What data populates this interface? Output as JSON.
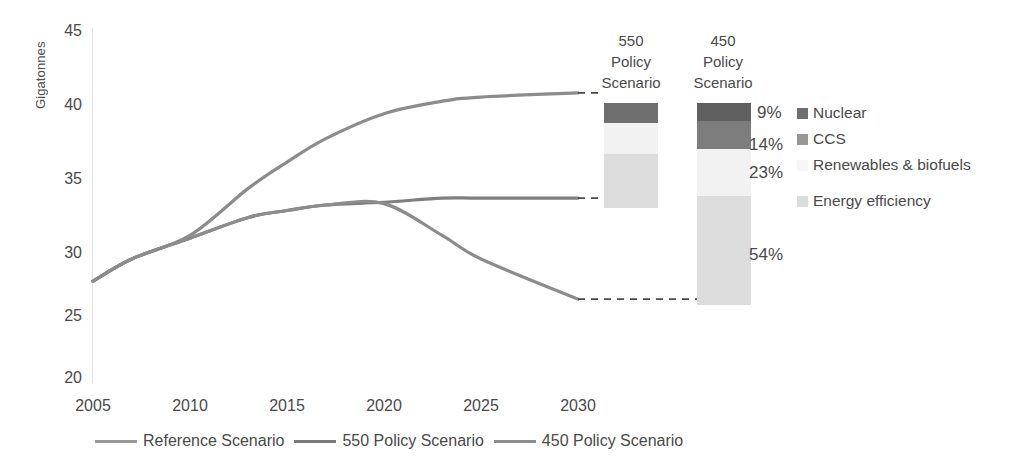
{
  "chart_data": {
    "type": "line",
    "title": "",
    "xlabel": "",
    "ylabel": "Gigatonnes",
    "xlim": [
      2005,
      2030
    ],
    "ylim": [
      20,
      45
    ],
    "grid": false,
    "legend_position": "bottom",
    "x": [
      2005,
      2010,
      2015,
      2020,
      2025,
      2030
    ],
    "yticks": [
      "45",
      "40",
      "35",
      "30",
      "25",
      "20"
    ],
    "xticks": [
      "2005",
      "2010",
      "2015",
      "2020",
      "2025",
      "2030"
    ],
    "series": [
      {
        "name": "Reference Scenario",
        "color": "#8c8c8c",
        "x": [
          2005,
          2007,
          2010,
          2013,
          2015,
          2017,
          2020,
          2023,
          2025,
          2030
        ],
        "values": [
          27.0,
          28.6,
          30.3,
          33.7,
          35.6,
          37.3,
          39.1,
          40.0,
          40.3,
          40.6
        ],
        "end_value": 40.6
      },
      {
        "name": "550 Policy Scenario",
        "color": "#7f7f7f",
        "x": [
          2005,
          2007,
          2010,
          2013,
          2015,
          2017,
          2020,
          2023,
          2025,
          2030
        ],
        "values": [
          27.0,
          28.6,
          30.1,
          31.6,
          32.1,
          32.5,
          32.7,
          33.0,
          33.0,
          33.0
        ],
        "end_value": 33.0
      },
      {
        "name": "450 Policy Scenario",
        "color": "#8c8c8c",
        "x": [
          2005,
          2007,
          2010,
          2013,
          2015,
          2017,
          2020,
          2023,
          2025,
          2030
        ],
        "values": [
          27.0,
          28.6,
          30.1,
          31.6,
          32.1,
          32.5,
          32.6,
          30.3,
          28.6,
          25.7
        ],
        "end_value": 25.7
      }
    ],
    "annotations": [
      {
        "text": "dashed connector from Reference Scenario 2030 endpoint to top of 550 Policy Scenario abatement bar",
        "value": 40.6
      },
      {
        "text": "dashed connector from 550 Policy Scenario 2030 endpoint to bottom of 550 bar / top of 450 bar region",
        "value": 33.0
      },
      {
        "text": "dashed connector from 450 Policy Scenario 2030 endpoint to bottom of 450 Policy Scenario abatement bar",
        "value": 25.7
      }
    ]
  },
  "bars": {
    "b550": {
      "header": "550\nPolicy\nScenario",
      "header_lines": [
        "550",
        "Policy",
        "Scenario"
      ],
      "top_value": 40.6,
      "bottom_value": 33.0,
      "segments": [
        {
          "name": "Nuclear",
          "share": 0.19,
          "color": "#6f6f6f"
        },
        {
          "name": "CCS",
          "share": 0.0,
          "color": "#969696"
        },
        {
          "name": "Renewables & biofuels",
          "share": 0.3,
          "color": "#f2f2f2"
        },
        {
          "name": "Energy efficiency",
          "share": 0.51,
          "color": "#dcdcdc"
        }
      ]
    },
    "b450": {
      "header": "450\nPolicy\nScenario",
      "header_lines": [
        "450",
        "Policy",
        "Scenario"
      ],
      "top_value": 40.6,
      "bottom_value": 25.7,
      "segments": [
        {
          "name": "Nuclear",
          "share": 0.09,
          "label": "9%",
          "color": "#5f5f5f"
        },
        {
          "name": "CCS",
          "share": 0.14,
          "label": "14%",
          "color": "#7d7d7d"
        },
        {
          "name": "Renewables & biofuels",
          "share": 0.23,
          "label": "23%",
          "color": "#f2f2f2"
        },
        {
          "name": "Energy efficiency",
          "share": 0.54,
          "label": "54%",
          "color": "#dcdcdc"
        }
      ]
    }
  },
  "right_legend": {
    "items": [
      {
        "label": "Nuclear",
        "color": "#6f6f6f"
      },
      {
        "label": "CCS",
        "color": "#969696"
      },
      {
        "label": "Renewables & biofuels",
        "color": "#f7f7f7"
      },
      {
        "label": "Energy efficiency",
        "color": "#dcdcdc"
      }
    ]
  },
  "bottom_legend": {
    "items": [
      {
        "label": "Reference Scenario",
        "color": "#9a9a9a"
      },
      {
        "label": "550 Policy Scenario",
        "color": "#7a7a7a"
      },
      {
        "label": "450 Policy Scenario",
        "color": "#8c8c8c"
      }
    ]
  },
  "percent_labels": {
    "p1": "9%",
    "p2": "14%",
    "p3": "23%",
    "p4": "54%"
  }
}
